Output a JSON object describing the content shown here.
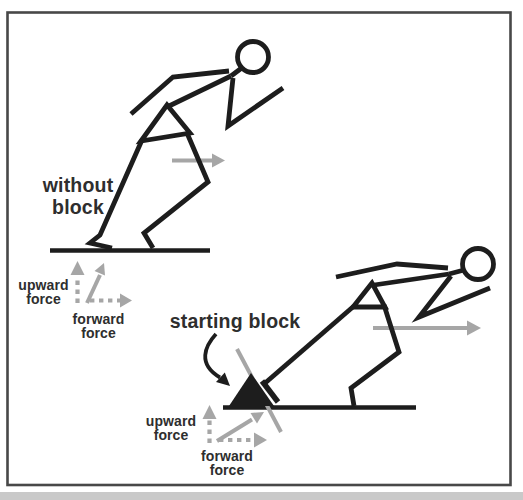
{
  "colors": {
    "ink": "#1d1d1d",
    "gray": "#a6a6a6",
    "text": "#2e2e2e",
    "border": "#484848",
    "page_edge": "#c9c9c9"
  },
  "scene1": {
    "caption": [
      "without",
      "block"
    ],
    "upward_force_label": [
      "upward",
      "force"
    ],
    "forward_force_label": [
      "forward",
      "force"
    ]
  },
  "scene2": {
    "caption": "starting block",
    "upward_force_label": [
      "upward",
      "force"
    ],
    "forward_force_label": [
      "forward",
      "force"
    ]
  }
}
